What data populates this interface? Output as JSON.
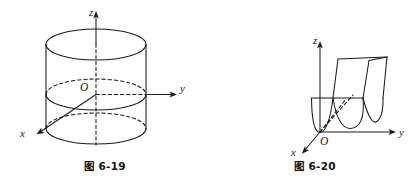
{
  "page": {
    "background_color": "#ffffff",
    "ink_color": "#1a1a1a",
    "width": 420,
    "height": 191
  },
  "figures": [
    {
      "id": "fig-6-19",
      "caption_prefix": "图",
      "caption_number": "6-19",
      "caption_full": "图 6-19",
      "subject": "circular cylinder with coordinate axes",
      "axes": {
        "z_label": "z",
        "y_label": "y",
        "x_label": "x",
        "origin_label": "O"
      },
      "geometry": {
        "shape": "cylinder",
        "ellipse_count": 3,
        "ellipses": [
          "top-rim-solid",
          "middle-rim-at-origin",
          "bottom-rim"
        ],
        "hidden_lines": "dashed"
      }
    },
    {
      "id": "fig-6-20",
      "caption_prefix": "图",
      "caption_number": "6-20",
      "caption_full": "图 6-20",
      "subject": "parabolic cylinder surface with coordinate axes",
      "axes": {
        "z_label": "z",
        "y_label": "y",
        "x_label": "x",
        "origin_label": "O"
      },
      "geometry": {
        "shape": "parabolic-cylinder",
        "parabola_count": 2,
        "parabolas": [
          "front-parabola-through-origin",
          "back-parabola-offset"
        ],
        "hidden_lines": "dashed"
      }
    }
  ]
}
